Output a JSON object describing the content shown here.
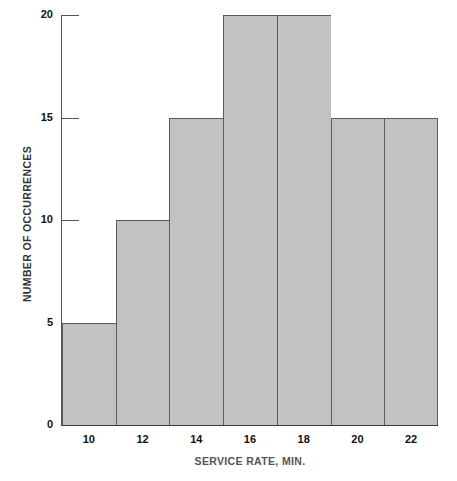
{
  "chart_data": {
    "type": "bar",
    "title": "",
    "subtitle": "",
    "xlabel": "SERVICE RATE, MIN.",
    "ylabel": "NUMBER OF OCCURRENCES",
    "categories": [
      "10",
      "12",
      "14",
      "16",
      "18",
      "20",
      "22"
    ],
    "values": [
      5,
      10,
      15,
      20,
      20,
      15,
      15
    ],
    "xtick_labels": [
      "10",
      "12",
      "14",
      "16",
      "18",
      "20",
      "22"
    ],
    "ytick_labels": [
      "0",
      "5",
      "10",
      "15",
      "20"
    ],
    "ytick_values": [
      0,
      5,
      10,
      15,
      20
    ],
    "ylim": [
      0,
      20
    ],
    "xlim": [
      9,
      23
    ],
    "bin_width": 2,
    "grid": false,
    "legend": false,
    "legend_position": "none",
    "bar_fill_color": "#c2c2c2",
    "bar_edge_color": "#5a5a5a",
    "axis_color": "#555555",
    "tick_label_color": "#111111",
    "xlabel_color": "#555555",
    "ylabel_color": "#333333",
    "background_color": "#ffffff"
  }
}
